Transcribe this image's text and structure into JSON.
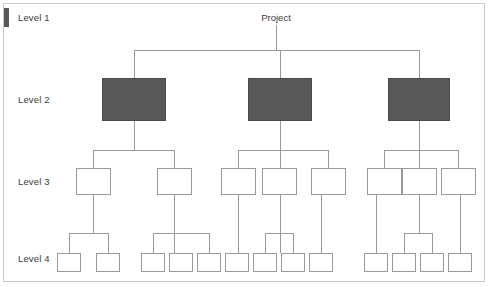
{
  "diagram": {
    "root_label": "Project",
    "accent_color": "#585858",
    "line_color": "#9a9a9a",
    "frame_color": "#c9c9c9",
    "levels": [
      {
        "label": "Level 1",
        "y": 13,
        "node_count": 1
      },
      {
        "label": "Level 2",
        "y": 95,
        "node_count": 3
      },
      {
        "label": "Level 3",
        "y": 177,
        "node_count": 8
      },
      {
        "label": "Level 4",
        "y": 254,
        "node_count": 13
      }
    ],
    "level_labels": {
      "level1": "Level 1",
      "level2": "Level 2",
      "level3": "Level 3",
      "level4": "Level 4"
    },
    "nodes": {
      "level2": [
        {
          "id": "l2-a",
          "x": 102,
          "y": 78,
          "w": 64,
          "h": 43,
          "filled": true
        },
        {
          "id": "l2-b",
          "x": 248,
          "y": 78,
          "w": 64,
          "h": 43,
          "filled": true
        },
        {
          "id": "l2-c",
          "x": 388,
          "y": 78,
          "w": 62,
          "h": 43,
          "filled": true
        }
      ],
      "level3": [
        {
          "id": "l3-a1",
          "x": 76,
          "y": 168,
          "w": 35,
          "h": 27,
          "parent": "l2-a"
        },
        {
          "id": "l3-a2",
          "x": 157,
          "y": 168,
          "w": 35,
          "h": 27,
          "parent": "l2-a"
        },
        {
          "id": "l3-b1",
          "x": 221,
          "y": 168,
          "w": 35,
          "h": 27,
          "parent": "l2-b"
        },
        {
          "id": "l3-b2",
          "x": 262,
          "y": 168,
          "w": 35,
          "h": 27,
          "parent": "l2-b"
        },
        {
          "id": "l3-b3",
          "x": 311,
          "y": 168,
          "w": 35,
          "h": 27,
          "parent": "l2-b"
        },
        {
          "id": "l3-c1",
          "x": 367,
          "y": 168,
          "w": 35,
          "h": 27,
          "parent": "l2-c"
        },
        {
          "id": "l3-c2",
          "x": 402,
          "y": 168,
          "w": 35,
          "h": 27,
          "parent": "l2-c"
        },
        {
          "id": "l3-c3",
          "x": 441,
          "y": 168,
          "w": 35,
          "h": 27,
          "parent": "l2-c"
        }
      ],
      "level4": [
        {
          "id": "l4-1",
          "x": 57,
          "y": 253,
          "w": 24,
          "h": 19,
          "parent": "l3-a1"
        },
        {
          "id": "l4-2",
          "x": 96,
          "y": 253,
          "w": 24,
          "h": 19,
          "parent": "l3-a1"
        },
        {
          "id": "l4-3",
          "x": 141,
          "y": 253,
          "w": 24,
          "h": 19,
          "parent": "l3-a2"
        },
        {
          "id": "l4-4",
          "x": 169,
          "y": 253,
          "w": 24,
          "h": 19,
          "parent": "l3-a2"
        },
        {
          "id": "l4-5",
          "x": 197,
          "y": 253,
          "w": 24,
          "h": 19,
          "parent": "l3-a2"
        },
        {
          "id": "l4-6",
          "x": 225,
          "y": 253,
          "w": 24,
          "h": 19,
          "parent": "l3-b1"
        },
        {
          "id": "l4-7",
          "x": 253,
          "y": 253,
          "w": 24,
          "h": 19,
          "parent": "l3-b2"
        },
        {
          "id": "l4-8",
          "x": 281,
          "y": 253,
          "w": 24,
          "h": 19,
          "parent": "l3-b2"
        },
        {
          "id": "l4-9",
          "x": 309,
          "y": 253,
          "w": 24,
          "h": 19,
          "parent": "l3-b3"
        },
        {
          "id": "l4-10",
          "x": 364,
          "y": 253,
          "w": 24,
          "h": 19,
          "parent": "l3-c1"
        },
        {
          "id": "l4-11",
          "x": 392,
          "y": 253,
          "w": 24,
          "h": 19,
          "parent": "l3-c2"
        },
        {
          "id": "l4-12",
          "x": 420,
          "y": 253,
          "w": 24,
          "h": 19,
          "parent": "l3-c2"
        },
        {
          "id": "l4-13",
          "x": 448,
          "y": 253,
          "w": 24,
          "h": 19,
          "parent": "l3-c3"
        }
      ]
    }
  }
}
